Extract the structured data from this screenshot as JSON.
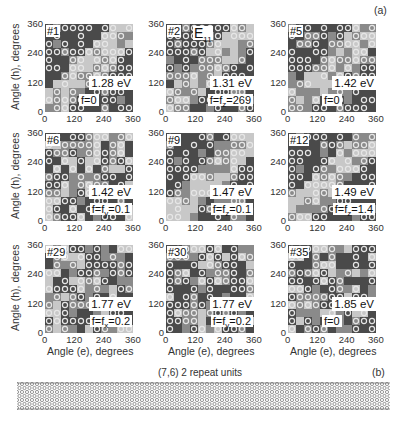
{
  "chart_data": {
    "type": "heatmap",
    "title": "",
    "panel_label_a": "(a)",
    "panel_label_b": "(b)",
    "xlabel": "Angle (e), degrees",
    "ylabel": "Angle (h), degrees",
    "xlim": [
      0,
      360
    ],
    "ylim": [
      0,
      360
    ],
    "xticks": [
      0,
      120,
      240,
      360
    ],
    "yticks": [
      0,
      120,
      240,
      360
    ],
    "grid": false,
    "annotation": "E11",
    "panels": [
      {
        "id": "#1",
        "energy": "1.28 eV",
        "f_pre": "f=0",
        "f_sub": "",
        "f_post": ""
      },
      {
        "id": "#2",
        "energy": "1.31 eV",
        "f_pre": "f=f",
        "f_sub": "z",
        "f_post": "=269"
      },
      {
        "id": "#5",
        "energy": "1.42 eV",
        "f_pre": "f=0",
        "f_sub": "",
        "f_post": ""
      },
      {
        "id": "#6",
        "energy": "1.42 eV",
        "f_pre": "f=f",
        "f_sub": "y",
        "f_post": "=0.1"
      },
      {
        "id": "#9",
        "energy": "1.47 eV",
        "f_pre": "f=f",
        "f_sub": "z",
        "f_post": "=0.1"
      },
      {
        "id": "#12",
        "energy": "1.49 eV",
        "f_pre": "f=f",
        "f_sub": "z",
        "f_post": "=1.4"
      },
      {
        "id": "#29",
        "energy": "1.77 eV",
        "f_pre": "f=f",
        "f_sub": "x",
        "f_post": "=0.2"
      },
      {
        "id": "#30",
        "energy": "1.77 eV",
        "f_pre": "f=f",
        "f_sub": "y",
        "f_post": "=0.2"
      },
      {
        "id": "#35",
        "energy": "1.85 eV",
        "f_pre": "f=0",
        "f_sub": "",
        "f_post": ""
      }
    ],
    "tube_label": "(7,6) 2 repeat units"
  },
  "colors": {
    "dark": "#4a4a4a",
    "mid": "#8a8a8a",
    "light": "#c8c8c8",
    "ring": "#e6e6e6"
  }
}
